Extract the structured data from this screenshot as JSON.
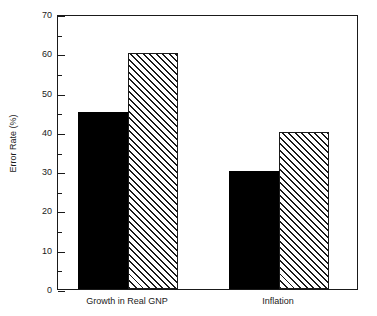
{
  "chart_data": {
    "type": "bar",
    "title": "",
    "subtitle": "",
    "xlabel": "",
    "ylabel": "Error Rate (%)",
    "ylim": [
      0,
      70
    ],
    "ytick_labels": [
      "0",
      "10",
      "20",
      "30",
      "40",
      "50",
      "60",
      "70"
    ],
    "ytick_values": [
      0,
      10,
      20,
      30,
      40,
      50,
      60,
      70
    ],
    "yminor_values": [
      5,
      15,
      25,
      35,
      45,
      55,
      65
    ],
    "grid": false,
    "legend": "none",
    "categories": [
      "Growth in Real GNP",
      "Inflation"
    ],
    "series": [
      {
        "name": "series-1",
        "style": "solid-black",
        "color": "#000000",
        "values": [
          45,
          30
        ]
      },
      {
        "name": "series-2",
        "style": "diagonal-hatch",
        "color": "#1a1a1a",
        "values": [
          60,
          40
        ]
      }
    ]
  },
  "axis": {
    "y_title": "Error Rate (%)",
    "frame_color": "#1a1a1a"
  }
}
